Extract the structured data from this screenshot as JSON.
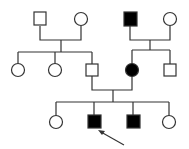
{
  "diagram": {
    "type": "pedigree",
    "colors": {
      "line": "#333333",
      "affected": "#000000",
      "unaffected": "#ffffff"
    },
    "individuals": [
      {
        "id": "I-1",
        "sex": "male",
        "affected": false,
        "x": 40,
        "y": 19
      },
      {
        "id": "I-2",
        "sex": "female",
        "affected": false,
        "x": 81,
        "y": 19
      },
      {
        "id": "I-3",
        "sex": "male",
        "affected": true,
        "x": 130,
        "y": 19
      },
      {
        "id": "I-4",
        "sex": "female",
        "affected": false,
        "x": 170,
        "y": 19
      },
      {
        "id": "II-1",
        "sex": "female",
        "affected": false,
        "x": 18,
        "y": 70
      },
      {
        "id": "II-2",
        "sex": "female",
        "affected": false,
        "x": 55,
        "y": 70
      },
      {
        "id": "II-3",
        "sex": "male",
        "affected": false,
        "x": 92,
        "y": 70
      },
      {
        "id": "II-4",
        "sex": "female",
        "affected": true,
        "x": 132,
        "y": 70
      },
      {
        "id": "II-5",
        "sex": "male",
        "affected": false,
        "x": 170,
        "y": 70
      },
      {
        "id": "III-1",
        "sex": "female",
        "affected": false,
        "x": 56,
        "y": 122
      },
      {
        "id": "III-2",
        "sex": "male",
        "affected": true,
        "proband": true,
        "x": 94,
        "y": 122
      },
      {
        "id": "III-3",
        "sex": "male",
        "affected": true,
        "x": 133,
        "y": 122
      },
      {
        "id": "III-4",
        "sex": "female",
        "affected": false,
        "x": 169,
        "y": 122
      }
    ],
    "proband_arrow": {
      "from": [
        124,
        145
      ],
      "to": [
        99,
        131
      ]
    }
  }
}
